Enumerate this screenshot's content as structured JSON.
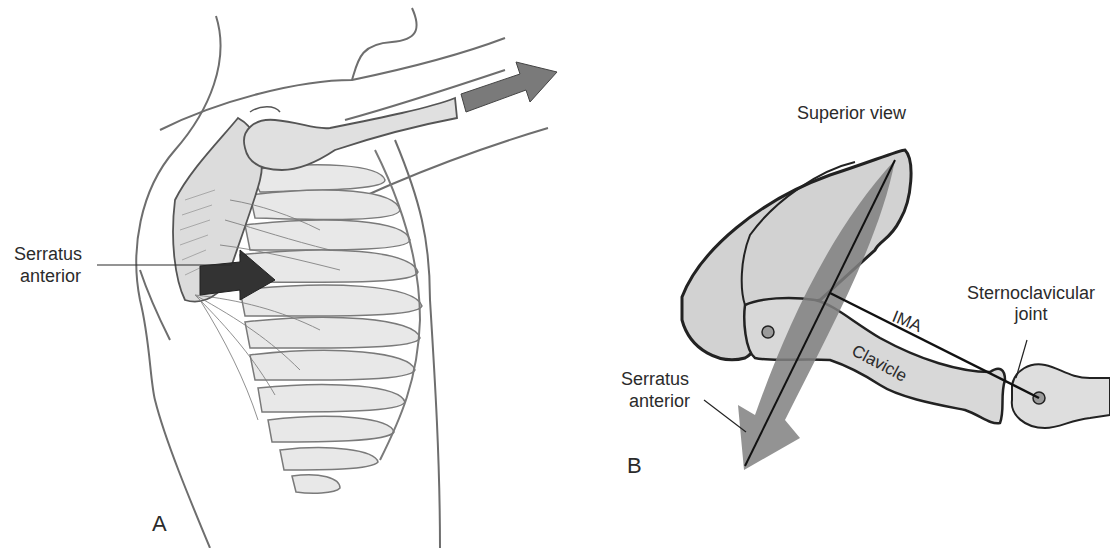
{
  "figure": {
    "panels": [
      {
        "id": "A",
        "letter": "A",
        "labels": {
          "serratus_line1": "Serratus",
          "serratus_line2": "anterior"
        }
      },
      {
        "id": "B",
        "letter": "B",
        "title": "Superior view",
        "labels": {
          "sternoclavicular_line1": "Sternoclavicular",
          "sternoclavicular_line2": "joint",
          "ima": "IMA",
          "clavicle": "Clavicle",
          "serratus_line1": "Serratus",
          "serratus_line2": "anterior"
        }
      }
    ],
    "colors": {
      "outline": "#2a2a2a",
      "bone_fill": "#d4d4d4",
      "bone_light": "#e6e6e6",
      "muscle_dark": "#3a3a3a",
      "arrow_gray": "#7a7a7a",
      "force_band": "#8c8c8c",
      "skin_line": "#6e6e6e"
    }
  }
}
